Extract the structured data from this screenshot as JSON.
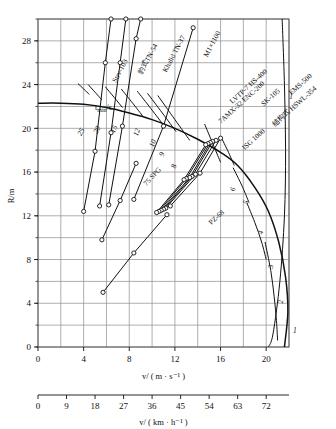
{
  "chart_data": {
    "type": "line",
    "title": "",
    "xlabel": "v/ ( m · s⁻¹ )",
    "xlabel2": "v/ ( km · h⁻¹ )",
    "ylabel": "R/m",
    "xlim": [
      0,
      22
    ],
    "ylim": [
      0,
      30
    ],
    "xlim_kmh": [
      0,
      79.2
    ],
    "grid": true,
    "legend_position": "inline-rotated-labels",
    "xticks": [
      0,
      4,
      8,
      12,
      16,
      20
    ],
    "xtick_labels": [
      "0",
      "4",
      "8",
      "12",
      "16",
      "20"
    ],
    "xgrid_step": 2,
    "xticks_kmh": [
      0,
      9,
      18,
      27,
      36,
      45,
      54,
      63,
      72
    ],
    "xtick_labels_kmh": [
      "0",
      "9",
      "18",
      "27",
      "36",
      "45",
      "54",
      "63",
      "72"
    ],
    "yticks": [
      0,
      4,
      8,
      12,
      16,
      20,
      24,
      28
    ],
    "ytick_labels": [
      "0",
      "4",
      "8",
      "12",
      "16",
      "20",
      "24",
      "28"
    ],
    "ygrid_step": 2,
    "time_family_label": "t_min/s",
    "time_family_sub": "min",
    "time_curve_labels": [
      "25",
      "20",
      "15",
      "12",
      "10",
      "9",
      "8",
      "6",
      "5",
      "4",
      "3",
      "2",
      "1"
    ],
    "time_curves": [
      {
        "label": "1",
        "t": 1,
        "points": [
          [
            21.4,
            30.0
          ],
          [
            21.6,
            24.0
          ],
          [
            21.7,
            18.0
          ],
          [
            21.6,
            12.0
          ],
          [
            21.2,
            6.0
          ],
          [
            20.6,
            1.2
          ],
          [
            20.2,
            0.0
          ]
        ]
      },
      {
        "label": "2",
        "t": 2,
        "points": [
          [
            19.9,
            9.6
          ],
          [
            20.4,
            7.0
          ],
          [
            20.7,
            4.6
          ],
          [
            20.9,
            2.4
          ],
          [
            21.0,
            0.6
          ]
        ]
      },
      {
        "label": "3",
        "t": 3,
        "points": [
          [
            18.3,
            13.2
          ],
          [
            19.0,
            11.4
          ],
          [
            19.6,
            9.6
          ],
          [
            20.0,
            8.0
          ]
        ]
      },
      {
        "label": "4",
        "t": 4,
        "points": [
          [
            17.1,
            16.4
          ],
          [
            17.9,
            14.7
          ],
          [
            18.5,
            13.2
          ]
        ]
      },
      {
        "label": "5",
        "t": 5,
        "points": [
          [
            16.0,
            19.3
          ],
          [
            16.7,
            17.8
          ],
          [
            17.2,
            16.6
          ]
        ]
      },
      {
        "label": "6",
        "t": 6,
        "points": [
          [
            14.6,
            20.4
          ],
          [
            15.4,
            18.4
          ],
          [
            16.0,
            16.9
          ]
        ]
      },
      {
        "label": "8",
        "t": 8,
        "points": [
          [
            10.5,
            23.0
          ],
          [
            12.0,
            20.8
          ],
          [
            13.3,
            18.9
          ]
        ]
      },
      {
        "label": "9",
        "t": 9,
        "points": [
          [
            9.6,
            23.2
          ],
          [
            10.9,
            21.4
          ],
          [
            12.1,
            19.7
          ]
        ]
      },
      {
        "label": "10",
        "t": 10,
        "points": [
          [
            8.7,
            23.4
          ],
          [
            9.9,
            21.8
          ],
          [
            11.0,
            20.3
          ]
        ]
      },
      {
        "label": "12",
        "t": 12,
        "points": [
          [
            7.3,
            23.6
          ],
          [
            8.3,
            22.3
          ],
          [
            9.2,
            21.1
          ]
        ]
      },
      {
        "label": "15",
        "t": 15,
        "points": [
          [
            5.9,
            23.8
          ],
          [
            6.7,
            22.8
          ],
          [
            7.4,
            21.9
          ]
        ]
      },
      {
        "label": "20",
        "t": 20,
        "points": [
          [
            4.4,
            24.0
          ],
          [
            5.0,
            23.3
          ],
          [
            5.6,
            22.6
          ]
        ]
      },
      {
        "label": "25",
        "t": 25,
        "points": [
          [
            3.5,
            24.1
          ],
          [
            4.0,
            23.6
          ],
          [
            4.5,
            23.1
          ]
        ]
      }
    ],
    "boundary_curve": {
      "name": "t_min envelope",
      "points": [
        [
          0.0,
          22.3
        ],
        [
          2.0,
          22.3
        ],
        [
          4.0,
          22.2
        ],
        [
          6.0,
          21.9
        ],
        [
          8.0,
          21.4
        ],
        [
          10.0,
          20.8
        ],
        [
          12.0,
          20.0
        ],
        [
          14.0,
          19.0
        ],
        [
          16.0,
          17.8
        ],
        [
          17.5,
          16.6
        ],
        [
          19.0,
          14.6
        ],
        [
          20.2,
          12.4
        ],
        [
          21.1,
          9.6
        ],
        [
          21.7,
          6.4
        ],
        [
          21.9,
          3.2
        ],
        [
          21.6,
          0.0
        ]
      ]
    },
    "series": [
      {
        "name": "Strv-103",
        "label": "Strv-103",
        "points": [
          [
            4.0,
            12.4
          ],
          [
            5.0,
            17.9
          ],
          [
            5.9,
            26.0
          ],
          [
            6.4,
            30.0
          ]
        ]
      },
      {
        "name": "BaoShi TN-54",
        "label": "豹式TN-54",
        "points": [
          [
            5.4,
            12.9
          ],
          [
            6.4,
            19.6
          ],
          [
            7.2,
            26.0
          ],
          [
            7.7,
            30.0
          ]
        ]
      },
      {
        "name": "Khalid TN-37",
        "label": "Khalid TN-37",
        "points": [
          [
            6.2,
            13.0
          ],
          [
            7.4,
            20.2
          ],
          [
            8.6,
            28.2
          ],
          [
            9.0,
            30.0
          ]
        ]
      },
      {
        "name": "M1x1100",
        "label": "M1×1100",
        "points": [
          [
            8.4,
            13.5
          ],
          [
            11.0,
            20.2
          ],
          [
            13.6,
            29.2
          ]
        ]
      },
      {
        "name": "75 SPG",
        "label": "75 SPG",
        "points": [
          [
            5.6,
            9.8
          ],
          [
            7.2,
            13.4
          ],
          [
            8.6,
            16.8
          ]
        ]
      },
      {
        "name": "LVTP-7 HS-400",
        "label": "LVTP-7 HS-400",
        "points": [
          [
            11.6,
            12.9
          ],
          [
            14.2,
            15.9
          ],
          [
            16.0,
            19.1
          ]
        ]
      },
      {
        "name": "AMX-32 ENC-200",
        "label": "7AMX-32 ENC-200",
        "points": [
          [
            11.2,
            12.7
          ],
          [
            13.8,
            15.8
          ],
          [
            15.6,
            18.9
          ]
        ]
      },
      {
        "name": "SK-105",
        "label": "SK-105",
        "points": [
          [
            11.0,
            12.6
          ],
          [
            13.5,
            15.6
          ],
          [
            15.3,
            18.8
          ]
        ]
      },
      {
        "name": "EMS-500",
        "label": "EMS-500",
        "points": [
          [
            10.8,
            12.5
          ],
          [
            13.3,
            15.5
          ],
          [
            15.1,
            18.7
          ]
        ]
      },
      {
        "name": "HSWL-354",
        "label": "结构式 HSWL-354",
        "points": [
          [
            10.6,
            12.4
          ],
          [
            13.0,
            15.4
          ],
          [
            14.9,
            18.6
          ]
        ]
      },
      {
        "name": "ISG 1000",
        "label": "ISG 1000",
        "points": [
          [
            10.4,
            12.3
          ],
          [
            12.8,
            15.3
          ],
          [
            14.7,
            18.5
          ]
        ]
      },
      {
        "name": "PZ-68",
        "label": "PZ-68",
        "points": [
          [
            5.7,
            5.0
          ],
          [
            8.4,
            8.6
          ],
          [
            11.3,
            12.1
          ]
        ]
      }
    ],
    "markers": "open-circle"
  },
  "axes": {
    "y_title": "R/m",
    "x_title_primary": "v/ ( m · s⁻¹ )",
    "x_title_secondary": "v/ ( km · h⁻¹ )"
  },
  "colors": {
    "curve": "#111111",
    "grid": "#8d8d8d",
    "frame": "#555555",
    "background": "#ffffff"
  }
}
